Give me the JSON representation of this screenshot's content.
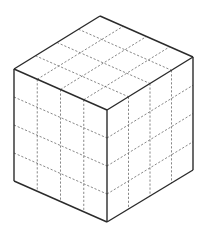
{
  "figure": {
    "title": "Cube divided into 4x4x4 unit cubes",
    "divisions": 4,
    "colors": {
      "background": "#ffffff",
      "edge": "#2b2b2b",
      "grid": "#555555"
    },
    "vertices": {
      "top": [
        100,
        16
      ],
      "left_top": [
        14,
        69
      ],
      "front_top": [
        107,
        110
      ],
      "right_top": [
        193,
        57
      ],
      "left_bottom": [
        14,
        181
      ],
      "front_bottom": [
        107,
        222
      ],
      "right_bottom": [
        193,
        170
      ]
    },
    "faces": [
      "top",
      "left",
      "right"
    ]
  }
}
